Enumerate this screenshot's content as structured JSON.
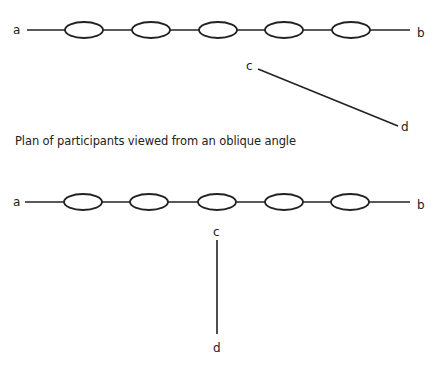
{
  "diagram": {
    "stroke_color": "#222222",
    "background": "#ffffff",
    "top": {
      "label_a": "a",
      "label_b": "b",
      "label_c": "c",
      "label_d": "d",
      "participants": 5
    },
    "caption": "Plan of participants viewed from an oblique angle",
    "bottom": {
      "label_a": "a",
      "label_b": "b",
      "label_c": "c",
      "label_d": "d",
      "participants": 5
    }
  }
}
